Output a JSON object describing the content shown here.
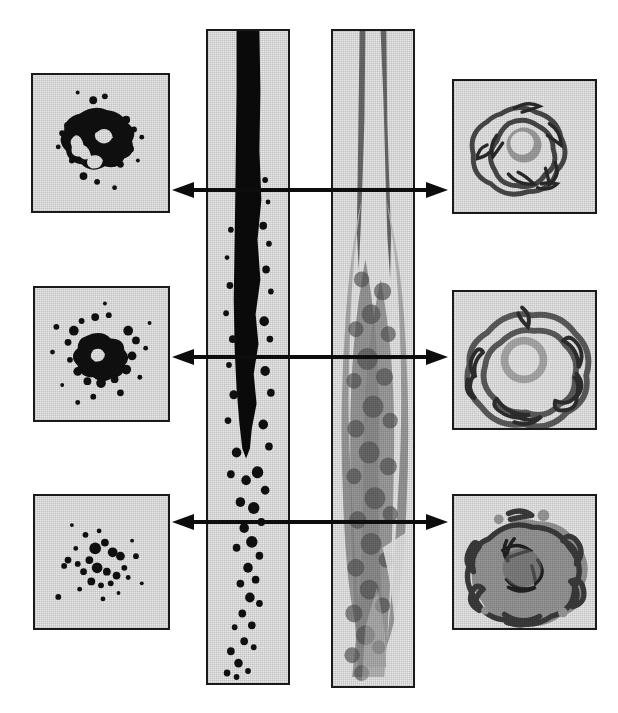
{
  "figure": {
    "background_color": "#ffffff",
    "panel_background_color": "#e9e9e9",
    "panel_border_color": "#1a1a1a",
    "arrow_color": "#0d0d0d",
    "width": 618,
    "height": 713
  },
  "columns": {
    "left_label": "Scalar (particle) cross-sections",
    "center_left_label": "Scalar side view",
    "center_right_label": "Vorticity side view",
    "right_label": "Vorticity cross-sections"
  },
  "stations": [
    {
      "id": "station-1",
      "row": 1,
      "arrow_y": 190,
      "label": "near field"
    },
    {
      "id": "station-2",
      "row": 2,
      "arrow_y": 357,
      "label": "intermediate field"
    },
    {
      "id": "station-3",
      "row": 3,
      "arrow_y": 522,
      "label": "far field"
    }
  ],
  "panels": {
    "left": [
      {
        "id": "left-xsection-1",
        "x": 31,
        "y": 73,
        "w": 139,
        "h": 140,
        "station": 1,
        "density": "dense",
        "seed": 11
      },
      {
        "id": "left-xsection-2",
        "x": 33,
        "y": 286,
        "w": 137,
        "h": 136,
        "station": 2,
        "density": "medium",
        "seed": 23
      },
      {
        "id": "left-xsection-3",
        "x": 33,
        "y": 494,
        "w": 137,
        "h": 136,
        "station": 3,
        "density": "sparse",
        "seed": 37
      }
    ],
    "center": [
      {
        "id": "center-strip-scalar",
        "x": 206,
        "y": 29,
        "w": 84,
        "h": 656,
        "seed": 5
      },
      {
        "id": "center-strip-vorticity",
        "x": 331,
        "y": 29,
        "w": 84,
        "h": 659,
        "seed": 8
      }
    ],
    "right": [
      {
        "id": "right-xsection-1",
        "x": 452,
        "y": 79,
        "w": 145,
        "h": 135,
        "station": 1,
        "density": "compact",
        "seed": 61
      },
      {
        "id": "right-xsection-2",
        "x": 452,
        "y": 290,
        "w": 145,
        "h": 140,
        "station": 2,
        "density": "broad",
        "seed": 73
      },
      {
        "id": "right-xsection-3",
        "x": 452,
        "y": 494,
        "w": 145,
        "h": 136,
        "station": 3,
        "density": "broad",
        "seed": 89
      }
    ]
  },
  "arrows": [
    {
      "id": "arrow-station-1",
      "y": 190,
      "left_tip_x": 172,
      "right_tip_x": 450,
      "double_headed": true
    },
    {
      "id": "arrow-station-2",
      "y": 357,
      "left_tip_x": 172,
      "right_tip_x": 450,
      "double_headed": true
    },
    {
      "id": "arrow-station-3",
      "y": 522,
      "left_tip_x": 172,
      "right_tip_x": 450,
      "double_headed": true
    }
  ]
}
